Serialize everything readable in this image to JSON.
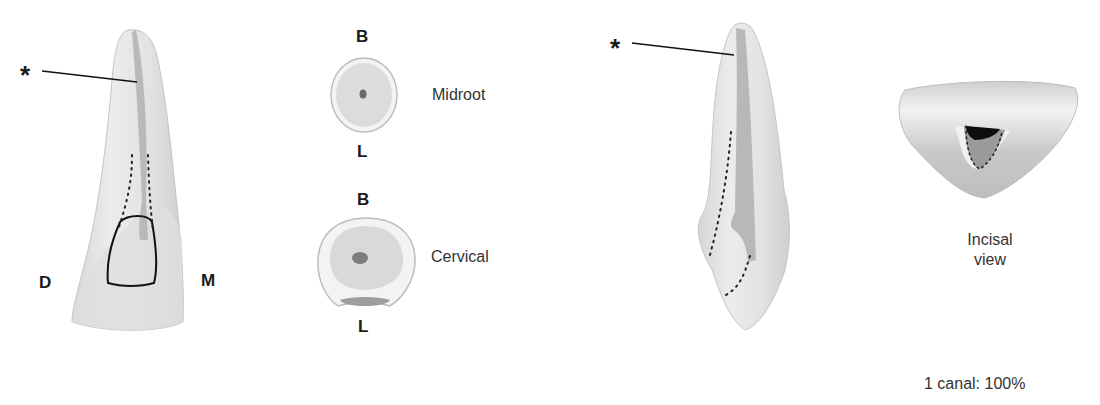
{
  "figure": {
    "labevel_view": {
      "asterisk": "*",
      "distal_label": "D",
      "mesial_label": "M"
    },
    "cross_sections": {
      "midroot": {
        "top_label": "B",
        "bottom_label": "L",
        "name": "Midroot"
      },
      "cervical": {
        "top_label": "B",
        "bottom_label": "L",
        "name": "Cervical"
      }
    },
    "proximal_view": {
      "asterisk": "*"
    },
    "incisal_view": {
      "caption_line1": "Incisal",
      "caption_line2": "view"
    },
    "canal_stat": "1 canal: 100%"
  },
  "colors": {
    "tooth_fill": "#e4e4e4",
    "tooth_shadow": "#c8c8c8",
    "canal": "#b5b5b5",
    "outline": "#111111"
  }
}
